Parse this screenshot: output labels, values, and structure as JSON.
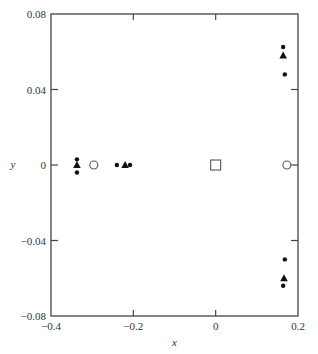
{
  "chart_data": {
    "type": "scatter",
    "title": "",
    "xlabel": "x",
    "ylabel": "y",
    "xlim": [
      -0.4,
      0.2
    ],
    "ylim": [
      -0.08,
      0.08
    ],
    "grid": false,
    "legend": null,
    "x_ticks": [
      -0.4,
      -0.2,
      0,
      0.2
    ],
    "x_tick_labels": [
      "−0.4",
      "−0.2",
      "0",
      "0.2"
    ],
    "y_ticks": [
      0.08,
      0.04,
      0,
      -0.04,
      -0.08
    ],
    "y_tick_labels": [
      "0.08",
      "0.04",
      "0",
      "−0.04",
      "−0.08"
    ],
    "series": [
      {
        "name": "filled-circles",
        "marker": "dot",
        "points": [
          {
            "x": -0.337,
            "y": 0.003
          },
          {
            "x": -0.337,
            "y": -0.004
          },
          {
            "x": -0.24,
            "y": 0.0
          },
          {
            "x": -0.208,
            "y": 0.0
          },
          {
            "x": 0.164,
            "y": 0.0625
          },
          {
            "x": 0.168,
            "y": 0.048
          },
          {
            "x": 0.168,
            "y": -0.05
          },
          {
            "x": 0.164,
            "y": -0.064
          }
        ]
      },
      {
        "name": "filled-triangles",
        "marker": "triangle",
        "points": [
          {
            "x": -0.337,
            "y": 0.0
          },
          {
            "x": -0.22,
            "y": 0.0
          },
          {
            "x": 0.164,
            "y": 0.058
          },
          {
            "x": 0.166,
            "y": -0.06
          }
        ]
      },
      {
        "name": "open-circles",
        "marker": "open-circle",
        "points": [
          {
            "x": -0.296,
            "y": 0.0
          },
          {
            "x": 0.173,
            "y": 0.0
          }
        ]
      },
      {
        "name": "open-square",
        "marker": "open-square",
        "points": [
          {
            "x": 0.0,
            "y": 0.0
          }
        ]
      }
    ]
  },
  "colors": {
    "axis": "#444444",
    "marker": "#111111",
    "background": "#ffffff"
  }
}
